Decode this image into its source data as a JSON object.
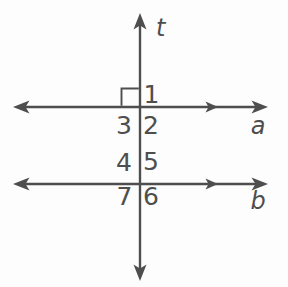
{
  "diagram": {
    "description_labels": {
      "transversal": "t",
      "line_a": "a",
      "line_b": "b"
    },
    "intersections": {
      "line_a": {
        "above_right": "1",
        "below_right": "2",
        "below_left": "3"
      },
      "line_b": {
        "above_left": "4",
        "above_right": "5",
        "below_right": "6",
        "below_left": "7"
      }
    },
    "marks": {
      "right_angle_mark": "square at upper-left of line a and transversal t",
      "parallel_marks": "single arrowhead on right half of line a and line b"
    },
    "colors": {
      "line": "#4e4e4e",
      "background": "#fdfdfd"
    }
  }
}
